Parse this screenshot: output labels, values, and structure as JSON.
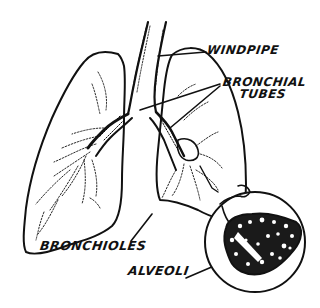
{
  "diagram": {
    "colors": {
      "ink": "#111111",
      "background": "#ffffff"
    },
    "labels": {
      "windpipe": "WINDPIPE",
      "bronchial_line1": "BRONCHIAL",
      "bronchial_line2": "TUBES",
      "bronchioles": "BRONCHIOLES",
      "alveoli": "ALVEOLI"
    },
    "parts": [
      "left-lung",
      "right-lung",
      "windpipe",
      "bronchial-tubes",
      "bronchioles",
      "alveoli-magnified-inset"
    ]
  }
}
